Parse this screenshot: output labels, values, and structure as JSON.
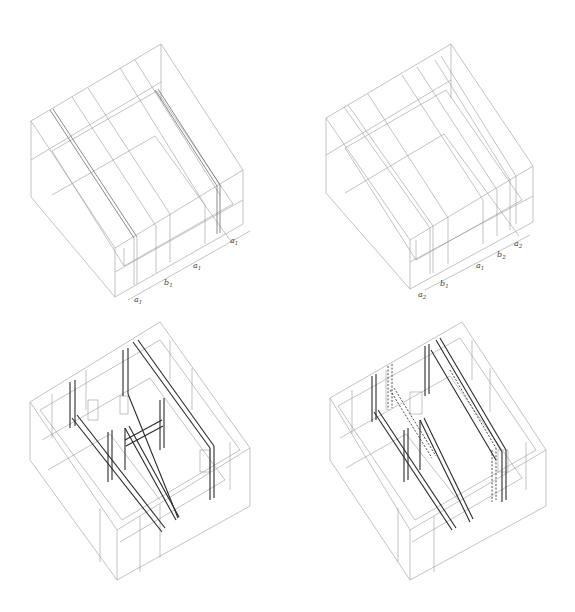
{
  "figure": {
    "panels": [
      {
        "id": "top-left",
        "type": "axonometric-bay-diagram",
        "dimension_labels": [
          {
            "base": "a",
            "sub": "1"
          },
          {
            "base": "b",
            "sub": "1"
          },
          {
            "base": "a",
            "sub": "1"
          },
          {
            "base": "a",
            "sub": "1"
          }
        ]
      },
      {
        "id": "top-right",
        "type": "axonometric-bay-diagram",
        "dimension_labels": [
          {
            "base": "a",
            "sub": "2"
          },
          {
            "base": "b",
            "sub": "1"
          },
          {
            "base": "a",
            "sub": "1"
          },
          {
            "base": "b",
            "sub": "2"
          },
          {
            "base": "a",
            "sub": "2"
          }
        ]
      },
      {
        "id": "bottom-left",
        "type": "axonometric-structure-drawing",
        "dimension_labels": []
      },
      {
        "id": "bottom-right",
        "type": "axonometric-structure-drawing",
        "dimension_labels": [],
        "notes": "includes dashed hidden structural members"
      }
    ]
  },
  "colors": {
    "background": "#ffffff",
    "line_light": "#9a9a9a",
    "line_dark": "#2a2a2a"
  }
}
